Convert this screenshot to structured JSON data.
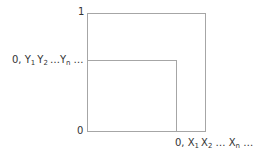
{
  "diagram": {
    "y_axis": {
      "top_label": "1",
      "bottom_label": "0",
      "sequence_label": {
        "prefix": "0, ",
        "terms": [
          {
            "base": "Y",
            "sub": "1"
          },
          {
            "base": "Y",
            "sub": "2"
          },
          {
            "base": "…Y",
            "sub": "n"
          }
        ],
        "suffix": " …"
      }
    },
    "x_axis": {
      "sequence_label": {
        "prefix": "0, ",
        "terms": [
          {
            "base": "X",
            "sub": "1"
          },
          {
            "base": "X",
            "sub": "2"
          },
          {
            "base": " … X",
            "sub": "n"
          }
        ],
        "suffix": " …"
      }
    },
    "colors": {
      "line": "#a6a6a6",
      "text": "#333333",
      "background": "#ffffff"
    }
  }
}
